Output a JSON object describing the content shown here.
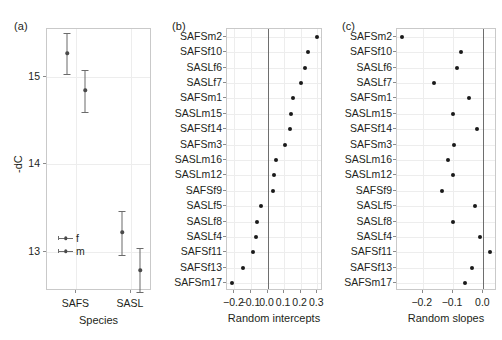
{
  "figure": {
    "background": "#ffffff",
    "point_color": "#1a1a1a",
    "errorbar_color": "#6b6b6b",
    "grid_color": "#ededed",
    "frame_color": "#c9c9c9",
    "zero_line_color": "#6e6e6e"
  },
  "panel_a": {
    "tag": "(a)",
    "xlabel": "Species",
    "ylabel": "-dC",
    "ylabel_full": "δ13C",
    "categories": [
      "SAFS",
      "SASL"
    ],
    "yticks": [
      "13",
      "14",
      "15"
    ],
    "ytick_values": [
      13,
      14,
      15
    ],
    "ylim": [
      12.55,
      15.55
    ],
    "legend": [
      {
        "key": "f",
        "label": "f"
      },
      {
        "key": "m",
        "label": "m"
      }
    ],
    "chart_data": {
      "type": "scatter",
      "title": "",
      "xlabel": "Species",
      "ylabel": "-dC",
      "ylim": [
        12.55,
        15.55
      ],
      "grid": true,
      "legend_position": "inside-bottom-left",
      "categories": [
        "SAFS",
        "SASL"
      ],
      "series": [
        {
          "name": "f",
          "values": [
            15.27,
            13.22
          ],
          "lower": [
            15.04,
            12.96
          ],
          "upper": [
            15.5,
            13.47
          ]
        },
        {
          "name": "m",
          "values": [
            14.85,
            12.79
          ],
          "lower": [
            14.6,
            12.54
          ],
          "upper": [
            15.08,
            13.04
          ]
        }
      ]
    }
  },
  "panel_b": {
    "tag": "(b)",
    "xlabel": "Random intercepts",
    "xticks": [
      "−0.2",
      "−0.1",
      "0.0",
      "0.1",
      "0.2",
      "0.3"
    ],
    "xtick_values": [
      -0.2,
      -0.1,
      0.0,
      0.1,
      0.2,
      0.3
    ],
    "xlim": [
      -0.245,
      0.335
    ],
    "chart_data": {
      "type": "scatter",
      "title": "",
      "xlabel": "Random intercepts",
      "ylabel": "",
      "xlim": [
        -0.245,
        0.335
      ],
      "grid": true,
      "reference_line": 0.0,
      "categories": [
        "SAFSm2",
        "SAFSf10",
        "SASLf6",
        "SASLf7",
        "SAFSm1",
        "SASLm15",
        "SAFSf14",
        "SAFSm3",
        "SASLm16",
        "SASLm12",
        "SAFSf9",
        "SASLf5",
        "SASLf8",
        "SASLf4",
        "SAFSf11",
        "SAFSf13",
        "SAFSm17"
      ],
      "values": [
        0.3,
        0.245,
        0.228,
        0.205,
        0.152,
        0.143,
        0.133,
        0.105,
        0.05,
        0.038,
        0.03,
        -0.042,
        -0.062,
        -0.072,
        -0.086,
        -0.147,
        -0.212
      ]
    }
  },
  "panel_c": {
    "tag": "(c)",
    "xlabel": "Random slopes",
    "xticks": [
      "−0.2",
      "−0.1",
      "0.0"
    ],
    "xtick_values": [
      -0.2,
      -0.1,
      0.0
    ],
    "xlim": [
      -0.285,
      0.045
    ],
    "chart_data": {
      "type": "scatter",
      "title": "",
      "xlabel": "Random slopes",
      "ylabel": "",
      "xlim": [
        -0.285,
        0.045
      ],
      "grid": true,
      "reference_line": 0.0,
      "categories": [
        "SAFSm2",
        "SAFSf10",
        "SASLf6",
        "SASLf7",
        "SAFSm1",
        "SASLm15",
        "SAFSf14",
        "SAFSm3",
        "SASLm16",
        "SASLm12",
        "SAFSf9",
        "SASLf5",
        "SASLf8",
        "SASLf4",
        "SAFSf11",
        "SAFSf13",
        "SAFSm17"
      ],
      "values": [
        -0.268,
        -0.073,
        -0.087,
        -0.164,
        -0.046,
        -0.1,
        -0.022,
        -0.097,
        -0.117,
        -0.101,
        -0.135,
        -0.026,
        -0.1,
        -0.01,
        0.022,
        -0.039,
        -0.06
      ]
    }
  }
}
